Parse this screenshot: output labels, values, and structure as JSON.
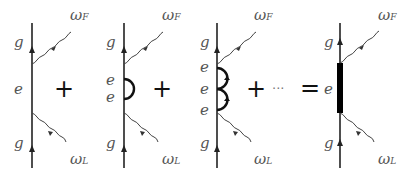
{
  "diagram": {
    "labels": {
      "ground": "g",
      "excited": "e",
      "omega": "ω",
      "final_sub": "F",
      "laser_sub": "L"
    },
    "operators": {
      "plus": "+",
      "ellipsis": "···",
      "equals": "="
    },
    "terms": [
      {
        "name": "bare",
        "loops": 0
      },
      {
        "name": "one-loop",
        "loops": 1
      },
      {
        "name": "two-loop",
        "loops": 2
      },
      {
        "name": "dressed",
        "loops": "thick-bar"
      }
    ]
  }
}
